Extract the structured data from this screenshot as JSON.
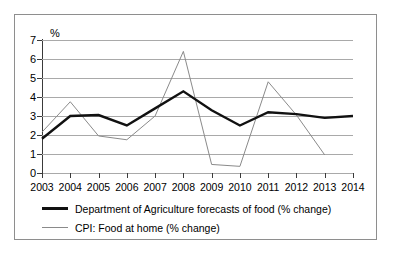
{
  "chart_data": {
    "type": "line",
    "title": "",
    "xlabel": "",
    "ylabel": "%",
    "unit_label": "%",
    "x": [
      2003,
      2004,
      2005,
      2006,
      2007,
      2008,
      2009,
      2010,
      2011,
      2012,
      2013,
      2014
    ],
    "categories": [
      "2003",
      "2004",
      "2005",
      "2006",
      "2007",
      "2008",
      "2009",
      "2010",
      "2011",
      "2012",
      "2013",
      "2014"
    ],
    "ylim": [
      0,
      7
    ],
    "yticks": [
      0,
      1,
      2,
      3,
      4,
      5,
      6,
      7
    ],
    "ytick_labels": [
      "0",
      "1",
      "2",
      "3",
      "4",
      "5",
      "6",
      "7"
    ],
    "grid": true,
    "legend_position": "below",
    "series": [
      {
        "name": "Department of Agriculture forecasts of food (% change)",
        "color": "#111111",
        "width": 2.4,
        "values": [
          1.8,
          3.0,
          3.05,
          2.5,
          3.4,
          4.3,
          3.3,
          2.5,
          3.2,
          3.1,
          2.9,
          3.0
        ]
      },
      {
        "name": "CPI: Food at home (% change)",
        "color": "#8a8a8a",
        "width": 1,
        "values": [
          2.15,
          3.75,
          1.95,
          1.75,
          3.0,
          6.4,
          0.45,
          0.35,
          4.8,
          3.05,
          0.95,
          null
        ]
      }
    ]
  },
  "legend": {
    "items": [
      {
        "label": "Department of Agriculture forecasts of food (% change)",
        "swatch": "thick-black-line"
      },
      {
        "label": "CPI: Food at home (% change)",
        "swatch": "thin-gray-line"
      }
    ]
  },
  "colors": {
    "usda_line": "#111111",
    "cpi_line": "#8a8a8a",
    "gridline": "#a9a9a9",
    "axis": "#3a3a3a",
    "border": "#8e8e8e",
    "background": "#ffffff"
  }
}
